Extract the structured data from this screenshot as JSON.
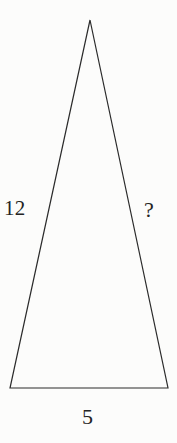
{
  "figure": {
    "type": "geometry-diagram",
    "shape": "isosceles-triangle",
    "background_color": "#fcfcfb",
    "stroke_color": "#2b2b2b",
    "stroke_width": 1.2,
    "text_color": "#232323",
    "vertices": {
      "apex": {
        "x": 90,
        "y": 20
      },
      "bottom_left": {
        "x": 10,
        "y": 388
      },
      "bottom_right": {
        "x": 168,
        "y": 388
      }
    },
    "labels": {
      "left_side": "12",
      "right_side": "?",
      "base": "5"
    }
  }
}
